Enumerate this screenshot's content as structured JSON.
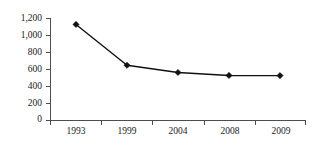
{
  "chart_data": {
    "type": "line",
    "title": "",
    "subtitle": "",
    "xlabel": "",
    "ylabel": "",
    "categories": [
      "1993",
      "1999",
      "2004",
      "2008",
      "2009"
    ],
    "values": [
      1130,
      650,
      565,
      530,
      528
    ],
    "series": [
      {
        "name": "",
        "values": [
          1130,
          650,
          565,
          530,
          528
        ]
      }
    ],
    "ylim": [
      0,
      1200
    ],
    "ytick_labels": [
      "0",
      "200",
      "400",
      "600",
      "800",
      "1,000",
      "1,200"
    ],
    "ytick_values": [
      0,
      200,
      400,
      600,
      800,
      1000,
      1200
    ],
    "grid": false,
    "legend": "none",
    "marker": "diamond",
    "line_color": "#111111",
    "marker_color": "#111111",
    "axis_color": "#4d4d4d",
    "background_color": "#ffffff"
  },
  "labels": {
    "y0": "0",
    "y1": "200",
    "y2": "400",
    "y3": "600",
    "y4": "800",
    "y5": "1,000",
    "y6": "1,200",
    "x0": "1993",
    "x1": "1999",
    "x2": "2004",
    "x3": "2008",
    "x4": "2009"
  }
}
